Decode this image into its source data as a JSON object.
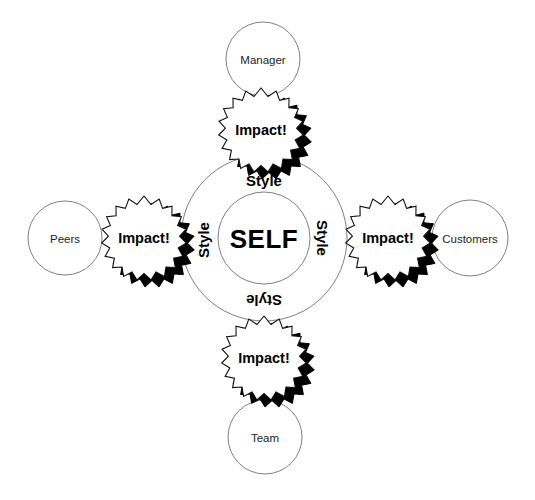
{
  "diagram": {
    "background_color": "#ffffff",
    "outline_color": "#808080",
    "text_color": "#231f20",
    "accent_color": "#000000",
    "center": {
      "self_label": "SELF",
      "ring_labels": [
        {
          "id": "style-top",
          "text": "Style",
          "position": "top",
          "rotation": 0
        },
        {
          "id": "style-right",
          "text": "Style",
          "position": "right",
          "rotation": 90
        },
        {
          "id": "style-bottom",
          "text": "Style",
          "position": "bottom",
          "rotation": 180
        },
        {
          "id": "style-left",
          "text": "Style",
          "position": "left",
          "rotation": 270
        }
      ]
    },
    "bursts": [
      {
        "id": "impact-top",
        "text": "Impact!",
        "position": "top"
      },
      {
        "id": "impact-right",
        "text": "Impact!",
        "position": "right"
      },
      {
        "id": "impact-bottom",
        "text": "Impact!",
        "position": "bottom"
      },
      {
        "id": "impact-left",
        "text": "Impact!",
        "position": "left"
      }
    ],
    "stakeholders": [
      {
        "id": "manager",
        "label": "Manager",
        "position": "top"
      },
      {
        "id": "customers",
        "label": "Customers",
        "position": "right"
      },
      {
        "id": "team",
        "label": "Team",
        "position": "bottom"
      },
      {
        "id": "peers",
        "label": "Peers",
        "position": "left"
      }
    ]
  }
}
